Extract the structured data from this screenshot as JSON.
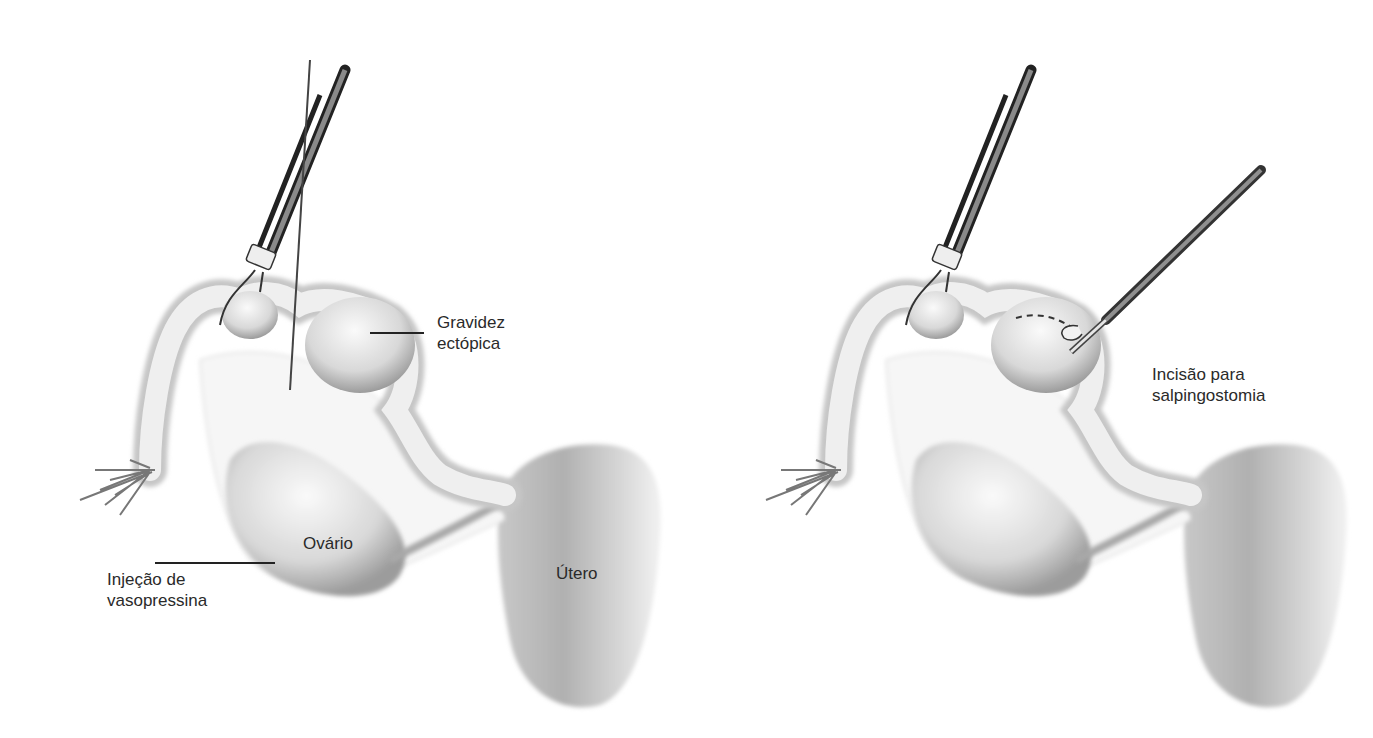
{
  "figure": {
    "panels": [
      {
        "id": "left",
        "description": "Vasopressin injection into mesosalpinx beneath ectopic pregnancy",
        "labels": {
          "ectopic": [
            "Gravidez",
            "ectópica"
          ],
          "ovary": "Ovário",
          "uterus": "Útero",
          "injection": [
            "Injeção de",
            "vasopressina"
          ]
        }
      },
      {
        "id": "right",
        "description": "Linear incision over ectopic pregnancy for salpingostomy",
        "labels": {
          "incision": [
            "Incisão para",
            "salpingostomia"
          ]
        }
      }
    ],
    "colors": {
      "background": "#ffffff",
      "tissue_light": "#f4f4f4",
      "tissue_shadow": "#9a9a9a",
      "instrument_dark": "#222222",
      "instrument_mid": "#8a8a8a",
      "text": "#2a2a2a"
    }
  }
}
